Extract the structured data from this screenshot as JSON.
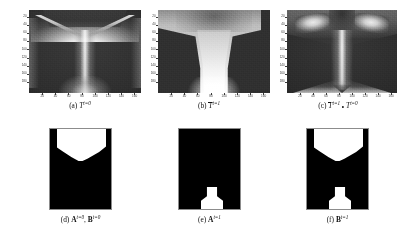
{
  "figure": {
    "panel_count": 6,
    "rows": 2,
    "columns": 3,
    "background_color": "#ffffff",
    "foreground_color": "#ffffff",
    "dark_color": "#2e2e2e"
  },
  "panels": [
    {
      "id": "a",
      "caption_prefix": "(a)",
      "symbol": "T",
      "symbol_overline": false,
      "superscript": "t=0",
      "caption_text": "(a) T^{t=0}",
      "type": "grayscale-heatmap",
      "description": "wineglass/Y shaped bright interface on dark background",
      "has_axes": true,
      "x_ticks": [
        20,
        40,
        60,
        80,
        100,
        120,
        140,
        160
      ],
      "y_ticks": [
        20,
        40,
        60,
        80,
        100,
        120,
        140,
        160,
        180
      ],
      "xlim": [
        0,
        170
      ],
      "ylim": [
        0,
        190
      ]
    },
    {
      "id": "b",
      "caption_prefix": "(b)",
      "symbol": "T",
      "symbol_overline": true,
      "superscript": "t=1",
      "caption_text": "(b) T̄^{t=1}",
      "type": "grayscale-heatmap",
      "description": "bright funnel column widening toward top, dark trapezoids at left and right",
      "has_axes": true,
      "x_ticks": [
        20,
        40,
        60,
        80,
        100,
        120,
        140,
        160
      ],
      "y_ticks": [
        20,
        40,
        60,
        80,
        100,
        120,
        140,
        160,
        180
      ],
      "xlim": [
        0,
        170
      ],
      "ylim": [
        0,
        190
      ]
    },
    {
      "id": "c",
      "caption_prefix": "(c)",
      "symbol": "T",
      "symbol_overline": true,
      "superscript": "t=1",
      "compose_operator": "∘",
      "symbol2": "T",
      "superscript2": "t=0",
      "caption_text": "(c) T̄^{t=1} ∘ T^{t=0}",
      "type": "grayscale-heatmap",
      "description": "anvil/T shape with bright lobes upper-left and upper-right and bright narrow stem",
      "has_axes": true,
      "x_ticks": [
        20,
        40,
        60,
        80,
        100,
        120,
        140,
        160
      ],
      "y_ticks": [
        20,
        40,
        60,
        80,
        100,
        120,
        140,
        160,
        180
      ],
      "xlim": [
        0,
        170
      ],
      "ylim": [
        0,
        190
      ]
    },
    {
      "id": "d",
      "caption_prefix": "(d)",
      "symbol": "A",
      "superscript": "t=0",
      "symbol2": "B",
      "superscript2": "t=0",
      "separator": ",",
      "caption_text": "(d) A^{t=0}, B^{t=0}",
      "type": "binary-mask",
      "description": "white region filling upper portion with V shaped notch along its lower boundary",
      "has_axes": false
    },
    {
      "id": "e",
      "caption_prefix": "(e)",
      "symbol": "A",
      "superscript": "t=1",
      "caption_text": "(e) A^{t=1}",
      "type": "binary-mask",
      "description": "small white pedestal/flask shape at bottom center",
      "has_axes": false
    },
    {
      "id": "f",
      "caption_prefix": "(f)",
      "symbol": "B",
      "superscript": "t=1",
      "caption_text": "(f) B^{t=1}",
      "type": "binary-mask",
      "description": "white region at top with concave lower boundary plus white pedestal shape at bottom center",
      "has_axes": false
    }
  ]
}
